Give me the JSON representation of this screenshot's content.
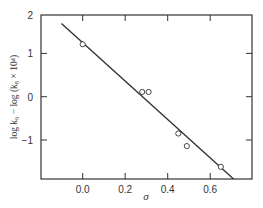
{
  "chart_data": {
    "type": "scatter",
    "title": "",
    "xlabel": "σ",
    "ylabel": "log k₉ − log (k₈ × 10⁴)",
    "xlim": [
      -0.2,
      0.79
    ],
    "ylim": [
      -1.89,
      1.87
    ],
    "x_ticks": [
      0.0,
      0.2,
      0.4,
      0.6
    ],
    "x_tick_labels": [
      "0.0",
      "0.2",
      "0.4",
      "0.6"
    ],
    "y_ticks": [
      2,
      1,
      0,
      -1
    ],
    "y_tick_labels": [
      "2",
      "1",
      "0",
      "−1"
    ],
    "grid": false,
    "legend": null,
    "series": [
      {
        "name": "observed",
        "marker": "open-circle",
        "points": [
          {
            "x": 0.0,
            "y": 1.21
          },
          {
            "x": 0.28,
            "y": 0.11
          },
          {
            "x": 0.31,
            "y": 0.11
          },
          {
            "x": 0.45,
            "y": -0.85
          },
          {
            "x": 0.49,
            "y": -1.14
          },
          {
            "x": 0.65,
            "y": -1.62
          }
        ]
      },
      {
        "name": "fit-line",
        "marker": "line",
        "points": [
          {
            "x": -0.1,
            "y": 1.69
          },
          {
            "x": 0.71,
            "y": -1.9
          }
        ]
      }
    ]
  },
  "colors": {
    "ink": "#333333",
    "background": "#ffffff"
  }
}
